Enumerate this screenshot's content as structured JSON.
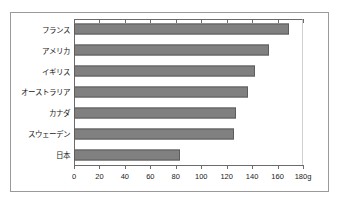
{
  "chart_data": {
    "type": "bar",
    "orientation": "horizontal",
    "title": "",
    "subtitle": "",
    "xlabel": "",
    "ylabel": "",
    "unit_suffix": "g",
    "xlim": [
      0,
      180
    ],
    "xticks": [
      0,
      20,
      40,
      60,
      80,
      100,
      120,
      140,
      160,
      180
    ],
    "xtick_labels": [
      "0",
      "20",
      "40",
      "60",
      "80",
      "100",
      "120",
      "140",
      "160",
      "180g"
    ],
    "grid": false,
    "legend": "none",
    "categories": [
      "フランス",
      "アメリカ",
      "イギリス",
      "オーストラリア",
      "カナダ",
      "スウェーデン",
      "日本"
    ],
    "values": [
      169,
      153,
      142,
      137,
      127,
      126,
      83
    ],
    "bar_color": "#808080",
    "bar_border_color": "#5d5d5d",
    "axis_color": "#6b6b6b",
    "frame_color": "#9a9a9a",
    "text_color": "#1a1a1a"
  }
}
